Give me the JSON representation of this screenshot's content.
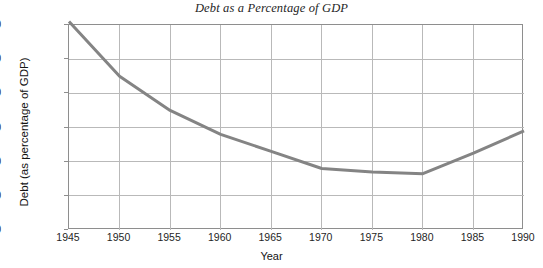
{
  "chart_data": {
    "type": "line",
    "title": "Debt as a Percentage of GDP",
    "xlabel": "Year",
    "ylabel": "Debt (as percentage of GDP)",
    "x": [
      1945,
      1950,
      1955,
      1960,
      1965,
      1970,
      1975,
      1980,
      1985,
      1990
    ],
    "values": [
      122,
      90,
      70,
      56,
      46,
      36,
      34,
      33,
      45,
      58
    ],
    "series": [
      {
        "name": "Debt (as percentage of GDP)",
        "values": [
          122,
          90,
          70,
          56,
          46,
          36,
          34,
          33,
          45,
          58
        ],
        "color": "#848484"
      }
    ],
    "xlim": [
      1945,
      1990
    ],
    "ylim": [
      0,
      120
    ],
    "xticks": [
      1945,
      1950,
      1955,
      1960,
      1965,
      1970,
      1975,
      1980,
      1985,
      1990
    ],
    "xtick_labels": [
      "1945",
      "1950",
      "1955",
      "1960",
      "1965",
      "1970",
      "1975",
      "1980",
      "1985",
      "1990"
    ],
    "yticks": [
      0,
      20,
      40,
      60,
      80,
      100,
      120
    ],
    "ytick_labels": [
      "0",
      "20",
      "40",
      "60",
      "80",
      "100",
      "120"
    ],
    "ytick_top_prefix": "%",
    "grid": "both",
    "legend": "none",
    "line_width": 3
  },
  "axes": {
    "y_unit_prefix": "%",
    "y_title": "Debt (as percentage of GDP)",
    "x_title": "Year"
  },
  "style": {
    "line_color": "#848484",
    "grid_color": "#b9b9b9",
    "frame_color": "#8e8e8e",
    "background": "#ffffff",
    "text_color": "#1a1a1a"
  }
}
